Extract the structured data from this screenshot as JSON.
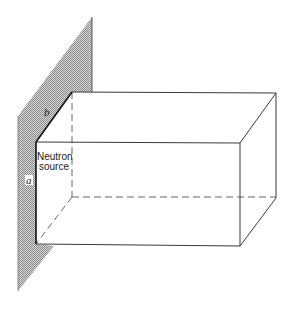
{
  "figure": {
    "type": "diagram",
    "colors": {
      "line": "#3a3a3a",
      "hatch_dark": "#8a8a8a",
      "hatch_light": "#d8d8d8",
      "background": "#ffffff"
    }
  },
  "labels": {
    "source_line1": "Neutron",
    "source_line2": "source",
    "dim_a": "a",
    "dim_b": "b"
  }
}
